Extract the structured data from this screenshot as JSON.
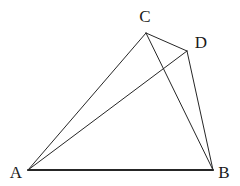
{
  "figure": {
    "canvas": {
      "width": 240,
      "height": 186,
      "background": "#ffffff"
    },
    "style": {
      "stroke_color": "#262626",
      "stroke_width": 1,
      "base_stroke_width": 2,
      "label_color": "#1a1a1a",
      "label_font_size": 17
    },
    "points": [
      {
        "id": "A",
        "label": "A",
        "x": 28,
        "y": 170,
        "label_x": 16,
        "label_y": 172
      },
      {
        "id": "B",
        "label": "B",
        "x": 213,
        "y": 170,
        "label_x": 224,
        "label_y": 172
      },
      {
        "id": "C",
        "label": "C",
        "x": 146,
        "y": 33,
        "label_x": 145,
        "label_y": 16
      },
      {
        "id": "D",
        "label": "D",
        "x": 187,
        "y": 51,
        "label_x": 201,
        "label_y": 42
      }
    ],
    "segments": [
      {
        "id": "AB",
        "from": "A",
        "to": "B",
        "weight": "base"
      },
      {
        "id": "AC",
        "from": "A",
        "to": "C",
        "weight": "thin"
      },
      {
        "id": "AD",
        "from": "A",
        "to": "D",
        "weight": "thin"
      },
      {
        "id": "CB",
        "from": "C",
        "to": "B",
        "weight": "thin"
      },
      {
        "id": "CD",
        "from": "C",
        "to": "D",
        "weight": "thin"
      },
      {
        "id": "DB",
        "from": "D",
        "to": "B",
        "weight": "thin"
      }
    ],
    "intersections": [
      {
        "id": "AD-x-CB",
        "x": 162,
        "y": 72,
        "marked": false
      }
    ]
  }
}
